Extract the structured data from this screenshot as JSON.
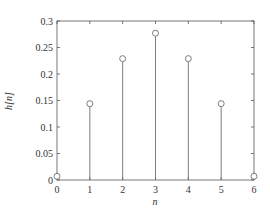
{
  "chart_data": {
    "type": "stem",
    "title": "",
    "xlabel": "n",
    "ylabel": "h[n]",
    "x": [
      0,
      1,
      2,
      3,
      4,
      5,
      6
    ],
    "values": [
      0.007,
      0.144,
      0.229,
      0.277,
      0.229,
      0.144,
      0.007
    ],
    "xlim": [
      0,
      6
    ],
    "ylim": [
      0,
      0.3
    ],
    "xticks": [
      "0",
      "1",
      "2",
      "3",
      "4",
      "5",
      "6"
    ],
    "yticks": [
      "0",
      "0.05",
      "0.1",
      "0.15",
      "0.2",
      "0.25",
      "0.3"
    ],
    "ytick_values": [
      0,
      0.05,
      0.1,
      0.15,
      0.2,
      0.25,
      0.3
    ],
    "grid": false,
    "legend": null,
    "marker": "open-circle",
    "colors": {
      "stem": "#6e6e6e",
      "axis": "#555555",
      "text": "#333333"
    }
  }
}
